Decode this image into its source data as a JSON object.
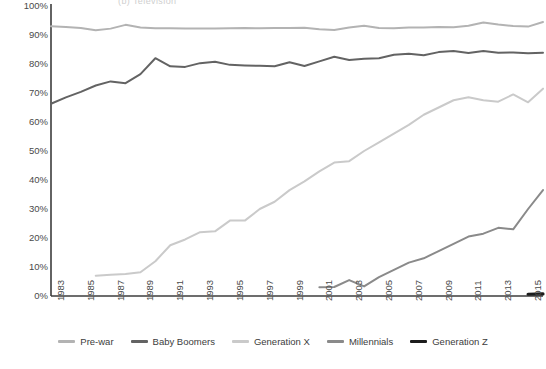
{
  "title": "(b)  Television",
  "chart_data": {
    "type": "line",
    "title": "(b)  Television",
    "xlabel": "",
    "ylabel": "",
    "ylim": [
      0,
      100
    ],
    "xlim": [
      1983,
      2016
    ],
    "grid": false,
    "legend_position": "bottom",
    "y_ticks": [
      "0%",
      "10%",
      "20%",
      "30%",
      "40%",
      "50%",
      "60%",
      "70%",
      "80%",
      "90%",
      "100%"
    ],
    "y_tick_values": [
      0,
      10,
      20,
      30,
      40,
      50,
      60,
      70,
      80,
      90,
      100
    ],
    "x_ticks": [
      "1983",
      "1985",
      "1987",
      "1989",
      "1991",
      "1993",
      "1995",
      "1997",
      "1999",
      "2001",
      "2003",
      "2005",
      "2007",
      "2009",
      "2011",
      "2013",
      "2015"
    ],
    "x_tick_values": [
      1983,
      1985,
      1987,
      1989,
      1991,
      1993,
      1995,
      1997,
      1999,
      2001,
      2003,
      2005,
      2007,
      2009,
      2011,
      2013,
      2015
    ],
    "series": [
      {
        "name": "Pre-war",
        "color": "#b3b3b3",
        "x": [
          1983,
          1984,
          1985,
          1986,
          1987,
          1988,
          1989,
          1990,
          1991,
          1992,
          1993,
          1994,
          1995,
          1996,
          1997,
          1998,
          1999,
          2000,
          2001,
          2002,
          2003,
          2004,
          2005,
          2006,
          2007,
          2008,
          2009,
          2010,
          2011,
          2012,
          2013,
          2014,
          2015,
          2016
        ],
        "values": [
          93.0,
          92.8,
          92.4,
          91.6,
          92.2,
          93.5,
          92.6,
          92.3,
          92.3,
          92.2,
          92.2,
          92.2,
          92.3,
          92.4,
          92.3,
          92.4,
          92.4,
          92.5,
          92.0,
          91.7,
          92.6,
          93.2,
          92.4,
          92.3,
          92.6,
          92.6,
          92.8,
          92.7,
          93.2,
          94.3,
          93.6,
          93.1,
          92.9,
          94.5
        ]
      },
      {
        "name": "Baby Boomers",
        "color": "#636363",
        "x": [
          1983,
          1984,
          1985,
          1986,
          1987,
          1988,
          1989,
          1990,
          1991,
          1992,
          1993,
          1994,
          1995,
          1996,
          1997,
          1998,
          1999,
          2000,
          2001,
          2002,
          2003,
          2004,
          2005,
          2006,
          2007,
          2008,
          2009,
          2010,
          2011,
          2012,
          2013,
          2014,
          2015,
          2016
        ],
        "values": [
          66.3,
          68.5,
          70.4,
          72.6,
          74.0,
          73.4,
          76.5,
          82.0,
          79.2,
          79.0,
          80.3,
          80.8,
          79.7,
          79.5,
          79.4,
          79.2,
          80.6,
          79.3,
          80.9,
          82.5,
          81.4,
          81.8,
          82.0,
          83.2,
          83.5,
          83.0,
          84.1,
          84.5,
          83.8,
          84.5,
          83.9,
          84.0,
          83.7,
          83.9
        ]
      },
      {
        "name": "Generation X",
        "color": "#cacaca",
        "x": [
          1986,
          1987,
          1988,
          1989,
          1990,
          1991,
          1992,
          1993,
          1994,
          1995,
          1996,
          1997,
          1998,
          1999,
          2000,
          2001,
          2002,
          2003,
          2004,
          2005,
          2006,
          2007,
          2008,
          2009,
          2010,
          2011,
          2012,
          2013,
          2014,
          2015,
          2016
        ],
        "values": [
          7.0,
          7.3,
          7.6,
          8.2,
          12.0,
          17.5,
          19.5,
          22.0,
          22.3,
          26.0,
          26.0,
          30.0,
          32.5,
          36.5,
          39.5,
          43.0,
          46.0,
          46.5,
          50.0,
          53.0,
          56.0,
          59.0,
          62.5,
          65.0,
          67.5,
          68.5,
          67.5,
          67.0,
          69.5,
          66.8,
          71.5
        ]
      },
      {
        "name": "Millennials",
        "color": "#8a8a8a",
        "x": [
          2001,
          2002,
          2003,
          2004,
          2005,
          2006,
          2007,
          2008,
          2009,
          2010,
          2011,
          2012,
          2013,
          2014,
          2015,
          2016
        ],
        "values": [
          3.0,
          3.1,
          5.5,
          3.3,
          6.5,
          9.0,
          11.5,
          13.0,
          15.5,
          18.0,
          20.5,
          21.5,
          23.5,
          23.0,
          30.0,
          36.5
        ]
      },
      {
        "name": "Generation Z",
        "color": "#1c1c1c",
        "x": [
          2015,
          2016
        ],
        "values": [
          0.6,
          0.7
        ]
      }
    ]
  },
  "legend": {
    "items": [
      {
        "label": "Pre-war",
        "color": "#b3b3b3"
      },
      {
        "label": "Baby Boomers",
        "color": "#636363"
      },
      {
        "label": "Generation X",
        "color": "#cacaca"
      },
      {
        "label": "Millennials",
        "color": "#8a8a8a"
      },
      {
        "label": "Generation Z",
        "color": "#1c1c1c"
      }
    ]
  },
  "axes": {
    "axis_color": "#3d3d3d"
  }
}
